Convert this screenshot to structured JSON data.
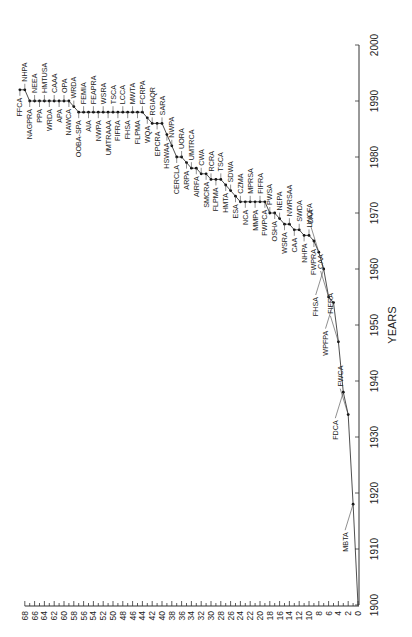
{
  "chart_data": {
    "type": "line",
    "orientation_note": "figure rotated 90 degrees counter-clockwise",
    "title": "",
    "xlabel": "YEARS",
    "ylabel": "",
    "xlim": [
      1900,
      2000
    ],
    "ylim": [
      0,
      68
    ],
    "x_ticks": [
      1900,
      1910,
      1920,
      1930,
      1940,
      1950,
      1960,
      1970,
      1980,
      1990,
      2000
    ],
    "y_ticks": [
      0,
      2,
      4,
      6,
      8,
      10,
      12,
      14,
      16,
      18,
      20,
      22,
      24,
      26,
      28,
      30,
      32,
      34,
      36,
      38,
      40,
      42,
      44,
      46,
      48,
      50,
      52,
      54,
      56,
      58,
      60,
      62,
      64,
      66,
      68
    ],
    "grid": false,
    "points": [
      {
        "year": 1900,
        "count": 0,
        "label": ""
      },
      {
        "year": 1918,
        "count": 1,
        "label": "MBTA"
      },
      {
        "year": 1934,
        "count": 2,
        "label": "FWCA"
      },
      {
        "year": 1938,
        "count": 3,
        "label": "FDCA"
      },
      {
        "year": 1947,
        "count": 4,
        "label": "FIFRA"
      },
      {
        "year": 1954,
        "count": 5,
        "label": "WPFPA"
      },
      {
        "year": 1955,
        "count": 6,
        "label": "CAA"
      },
      {
        "year": 1960,
        "count": 7,
        "label": "FHSA"
      },
      {
        "year": 1963,
        "count": 8,
        "label": "CAA"
      },
      {
        "year": 1965,
        "count": 9,
        "label": "FWPRA"
      },
      {
        "year": 1966,
        "count": 10,
        "label": "LWCFA"
      },
      {
        "year": 1966,
        "count": 11,
        "label": "NHPA"
      },
      {
        "year": 1967,
        "count": 12,
        "label": "SWDA"
      },
      {
        "year": 1967,
        "count": 13,
        "label": "CAA"
      },
      {
        "year": 1968,
        "count": 14,
        "label": "NWRSAA"
      },
      {
        "year": 1968,
        "count": 15,
        "label": "WSRA"
      },
      {
        "year": 1969,
        "count": 16,
        "label": "NEPA"
      },
      {
        "year": 1970,
        "count": 17,
        "label": "OSHA"
      },
      {
        "year": 1970,
        "count": 18,
        "label": "PWSA"
      },
      {
        "year": 1972,
        "count": 19,
        "label": "FWPCA"
      },
      {
        "year": 1972,
        "count": 20,
        "label": "FIFRA"
      },
      {
        "year": 1972,
        "count": 21,
        "label": "MMPA"
      },
      {
        "year": 1972,
        "count": 22,
        "label": "MPRSA"
      },
      {
        "year": 1972,
        "count": 23,
        "label": "NCA"
      },
      {
        "year": 1972,
        "count": 24,
        "label": "CZMA"
      },
      {
        "year": 1973,
        "count": 25,
        "label": "ESA"
      },
      {
        "year": 1974,
        "count": 26,
        "label": "SDWA"
      },
      {
        "year": 1975,
        "count": 27,
        "label": "HMTA"
      },
      {
        "year": 1976,
        "count": 28,
        "label": "TSCA"
      },
      {
        "year": 1976,
        "count": 29,
        "label": "FLPMA"
      },
      {
        "year": 1976,
        "count": 30,
        "label": "RCRA"
      },
      {
        "year": 1977,
        "count": 31,
        "label": "SMCRA"
      },
      {
        "year": 1977,
        "count": 32,
        "label": "CWA"
      },
      {
        "year": 1978,
        "count": 33,
        "label": "AIRFA"
      },
      {
        "year": 1978,
        "count": 34,
        "label": "UMTRCA"
      },
      {
        "year": 1979,
        "count": 35,
        "label": "ARPA"
      },
      {
        "year": 1980,
        "count": 36,
        "label": "UORA"
      },
      {
        "year": 1980,
        "count": 37,
        "label": "CERCLA"
      },
      {
        "year": 1982,
        "count": 38,
        "label": "NWPA"
      },
      {
        "year": 1984,
        "count": 39,
        "label": "HSWAA"
      },
      {
        "year": 1986,
        "count": 40,
        "label": "SARA"
      },
      {
        "year": 1986,
        "count": 41,
        "label": "EPCRA"
      },
      {
        "year": 1986,
        "count": 42,
        "label": "RGIAQR"
      },
      {
        "year": 1987,
        "count": 43,
        "label": "WQA"
      },
      {
        "year": 1988,
        "count": 44,
        "label": "FCRPA"
      },
      {
        "year": 1988,
        "count": 45,
        "label": "FLPMA"
      },
      {
        "year": 1988,
        "count": 46,
        "label": "MWTA"
      },
      {
        "year": 1988,
        "count": 47,
        "label": "FHSA"
      },
      {
        "year": 1988,
        "count": 48,
        "label": "LCCA"
      },
      {
        "year": 1988,
        "count": 49,
        "label": "FIFRA"
      },
      {
        "year": 1988,
        "count": 50,
        "label": "TSCA"
      },
      {
        "year": 1988,
        "count": 51,
        "label": "UMTRAAA"
      },
      {
        "year": 1988,
        "count": 52,
        "label": "WSRA"
      },
      {
        "year": 1988,
        "count": 53,
        "label": "NWPA"
      },
      {
        "year": 1988,
        "count": 54,
        "label": "FEAPRA"
      },
      {
        "year": 1988,
        "count": 55,
        "label": "AIA"
      },
      {
        "year": 1988,
        "count": 56,
        "label": "FEMIA"
      },
      {
        "year": 1988,
        "count": 57,
        "label": "OOBA-SPA"
      },
      {
        "year": 1989,
        "count": 58,
        "label": "WRDA"
      },
      {
        "year": 1990,
        "count": 59,
        "label": "NAWCA"
      },
      {
        "year": 1990,
        "count": 60,
        "label": "OPA"
      },
      {
        "year": 1990,
        "count": 61,
        "label": "APA"
      },
      {
        "year": 1990,
        "count": 62,
        "label": "CAAA"
      },
      {
        "year": 1990,
        "count": 63,
        "label": "WRDA"
      },
      {
        "year": 1990,
        "count": 64,
        "label": "HMTUSA"
      },
      {
        "year": 1990,
        "count": 65,
        "label": "PPA"
      },
      {
        "year": 1990,
        "count": 66,
        "label": "NEEA"
      },
      {
        "year": 1990,
        "count": 67,
        "label": "NAGPRA"
      },
      {
        "year": 1992,
        "count": 68,
        "label": "NHPA"
      },
      {
        "year": 1992,
        "count": 69,
        "label": "FFCA"
      }
    ]
  }
}
